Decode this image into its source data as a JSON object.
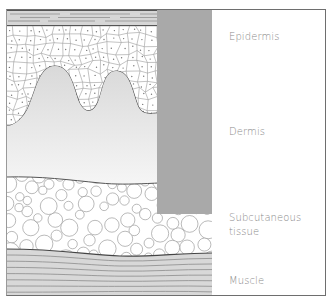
{
  "diagram": {
    "labels": [
      {
        "id": "epidermis",
        "text": "Epidermis"
      },
      {
        "id": "dermis",
        "text": "Dermis"
      },
      {
        "id": "subcutaneous",
        "text": "Subcutaneous"
      },
      {
        "id": "subcutaneous2",
        "text": "tissue"
      },
      {
        "id": "muscle",
        "text": "Muscle"
      }
    ],
    "colors": {
      "frame": "#6e6e6e",
      "shaded_bar": "#a9a9a9",
      "stratum": "#d4d4d4",
      "dermis_top": "#d3d3d3",
      "dermis_bottom": "#f4f4f4",
      "muscle": "#d8d8d8",
      "label_text": "#8a8a8a",
      "cell_line": "#9a9a9a"
    }
  }
}
